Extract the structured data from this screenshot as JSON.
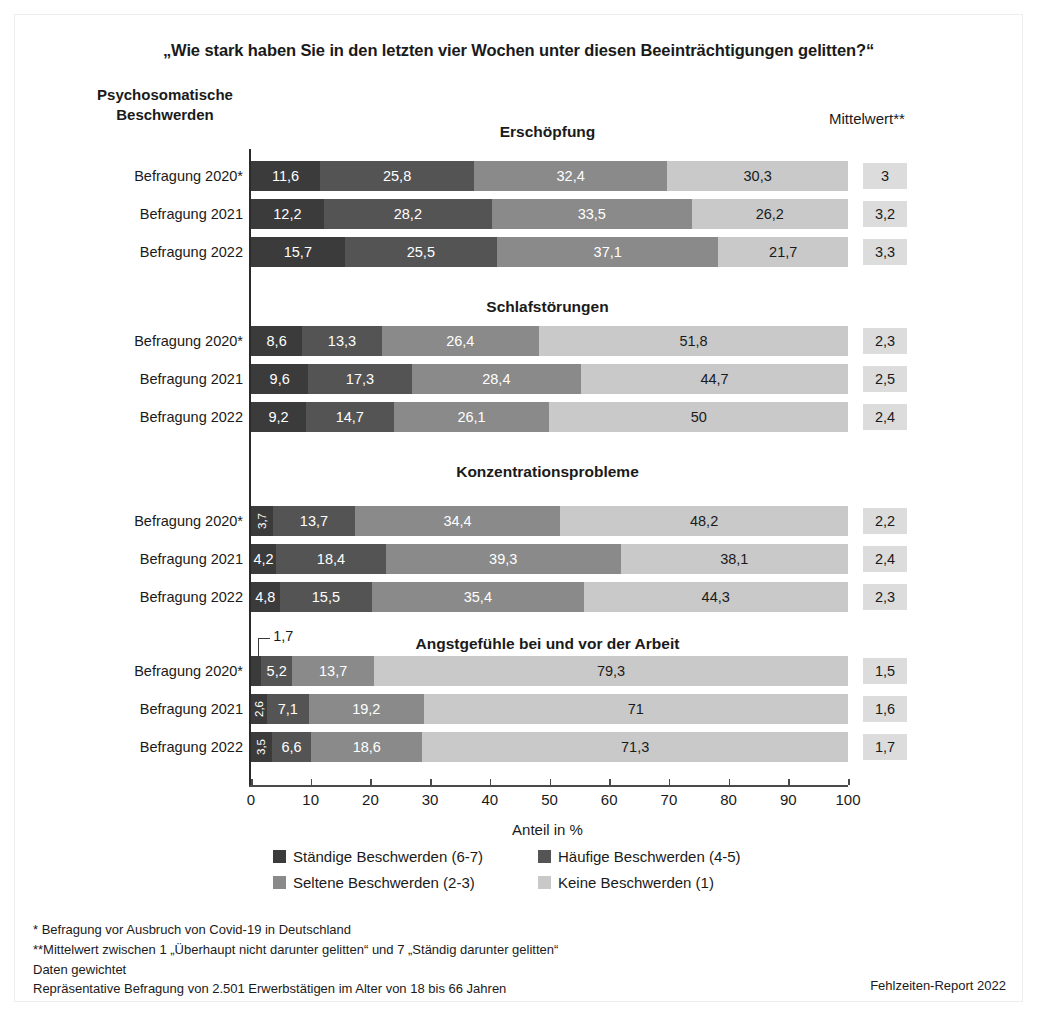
{
  "title": "„Wie stark haben Sie in den letzten vier Wochen unter diesen Beeinträchtigungen gelitten?“",
  "corner_header": "Psychosomatische\nBeschwerden",
  "corner_header_line1": "Psychosomatische",
  "corner_header_line2": "Beschwerden",
  "mean_header": "Mittelwert**",
  "colors": {
    "s1": "#3b3b3b",
    "s2": "#545454",
    "s3": "#8a8a8a",
    "s4": "#c9c9c9",
    "mean_box": "#dcdcdc",
    "axis": "#2b2b2b",
    "border": "#ededed",
    "background": "#ffffff"
  },
  "axis": {
    "label": "Anteil in %",
    "min": 0,
    "max": 100,
    "ticks": [
      0,
      10,
      20,
      30,
      40,
      50,
      60,
      70,
      80,
      90,
      100
    ],
    "tick_labels": [
      "0",
      "10",
      "20",
      "30",
      "40",
      "50",
      "60",
      "70",
      "80",
      "90",
      "100"
    ]
  },
  "legend": [
    {
      "label": "Ständige Beschwerden (6-7)",
      "color": "#3b3b3b",
      "key": "s1"
    },
    {
      "label": "Häufige Beschwerden (4-5)",
      "color": "#545454",
      "key": "s2"
    },
    {
      "label": "Seltene Beschwerden (2-3)",
      "color": "#8a8a8a",
      "key": "s3"
    },
    {
      "label": "Keine Beschwerden (1)",
      "color": "#c9c9c9",
      "key": "s4"
    }
  ],
  "footnotes": [
    "*  Befragung vor Ausbruch von Covid-19 in Deutschland",
    "**Mittelwert zwischen 1 „Überhaupt nicht darunter gelitten“ und 7 „Ständig darunter gelitten“",
    "Daten gewichtet",
    "Repräsentative Befragung von 2.501 Erwerbstätigen im Alter von 18 bis 66 Jahren"
  ],
  "credit": "Fehlzeiten-Report 2022",
  "chart_data": {
    "type": "bar",
    "orientation": "horizontal",
    "stacked": true,
    "normalized": true,
    "title": "„Wie stark haben Sie in den letzten vier Wochen unter diesen Beeinträchtigungen gelitten?“",
    "xlabel": "Anteil in %",
    "ylabel": "Psychosomatische Beschwerden",
    "xlim": [
      0,
      100
    ],
    "grid": false,
    "legend_position": "bottom",
    "series": [
      {
        "name": "Ständige Beschwerden (6-7)",
        "color": "#3b3b3b"
      },
      {
        "name": "Häufige Beschwerden (4-5)",
        "color": "#545454"
      },
      {
        "name": "Seltene Beschwerden (2-3)",
        "color": "#8a8a8a"
      },
      {
        "name": "Keine Beschwerden (1)",
        "color": "#c9c9c9"
      }
    ],
    "groups": [
      {
        "title": "Erschöpfung",
        "rows": [
          {
            "label": "Befragung 2020*",
            "values": [
              11.6,
              25.8,
              32.4,
              30.3
            ],
            "labels": [
              "11,6",
              "25,8",
              "32,4",
              "30,3"
            ],
            "mean": "3"
          },
          {
            "label": "Befragung 2021",
            "values": [
              12.2,
              28.2,
              33.5,
              26.2
            ],
            "labels": [
              "12,2",
              "28,2",
              "33,5",
              "26,2"
            ],
            "mean": "3,2"
          },
          {
            "label": "Befragung 2022",
            "values": [
              15.7,
              25.5,
              37.1,
              21.7
            ],
            "labels": [
              "15,7",
              "25,5",
              "37,1",
              "21,7"
            ],
            "mean": "3,3"
          }
        ]
      },
      {
        "title": "Schlafstörungen",
        "rows": [
          {
            "label": "Befragung 2020*",
            "values": [
              8.6,
              13.3,
              26.4,
              51.8
            ],
            "labels": [
              "8,6",
              "13,3",
              "26,4",
              "51,8"
            ],
            "mean": "2,3"
          },
          {
            "label": "Befragung 2021",
            "values": [
              9.6,
              17.3,
              28.4,
              44.7
            ],
            "labels": [
              "9,6",
              "17,3",
              "28,4",
              "44,7"
            ],
            "mean": "2,5"
          },
          {
            "label": "Befragung 2022",
            "values": [
              9.2,
              14.7,
              26.1,
              50.0
            ],
            "labels": [
              "9,2",
              "14,7",
              "26,1",
              "50"
            ],
            "mean": "2,4"
          }
        ]
      },
      {
        "title": "Konzentrationsprobleme",
        "rows": [
          {
            "label": "Befragung 2020*",
            "values": [
              3.7,
              13.7,
              34.4,
              48.2
            ],
            "labels": [
              "3,7",
              "13,7",
              "34,4",
              "48,2"
            ],
            "mean": "2,2",
            "rotate_first": true
          },
          {
            "label": "Befragung 2021",
            "values": [
              4.2,
              18.4,
              39.3,
              38.1
            ],
            "labels": [
              "4,2",
              "18,4",
              "39,3",
              "38,1"
            ],
            "mean": "2,4"
          },
          {
            "label": "Befragung 2022",
            "values": [
              4.8,
              15.5,
              35.4,
              44.3
            ],
            "labels": [
              "4,8",
              "15,5",
              "35,4",
              "44,3"
            ],
            "mean": "2,3"
          }
        ]
      },
      {
        "title": "Angstgefühle bei und vor der Arbeit",
        "rows": [
          {
            "label": "Befragung 2020*",
            "values": [
              1.7,
              5.2,
              13.7,
              79.3
            ],
            "labels": [
              "1,7",
              "5,2",
              "13,7",
              "79,3"
            ],
            "mean": "1,5",
            "callout_first": "1,7"
          },
          {
            "label": "Befragung 2021",
            "values": [
              2.6,
              7.1,
              19.2,
              71.0
            ],
            "labels": [
              "2,6",
              "7,1",
              "19,2",
              "71"
            ],
            "mean": "1,6",
            "rotate_first": true
          },
          {
            "label": "Befragung 2022",
            "values": [
              3.5,
              6.6,
              18.6,
              71.3
            ],
            "labels": [
              "3,5",
              "6,6",
              "18,6",
              "71,3"
            ],
            "mean": "1,7",
            "rotate_first": true
          }
        ]
      }
    ]
  }
}
